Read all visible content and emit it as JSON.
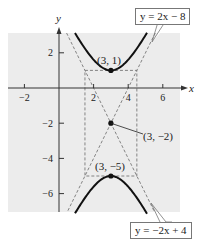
{
  "chart_data": {
    "type": "line",
    "title": "",
    "xlabel": "x",
    "ylabel": "y",
    "xlim": [
      -3,
      7
    ],
    "ylim": [
      -7,
      3
    ],
    "x_ticks": [
      -2,
      2,
      4,
      6
    ],
    "x_tick_labels": [
      "−2",
      "2",
      "4",
      "6"
    ],
    "y_ticks": [
      2,
      -2,
      -4,
      -6
    ],
    "y_tick_labels": [
      "2",
      "−2",
      "−4",
      "−6"
    ],
    "grid": false,
    "background": "#ececec",
    "curve": {
      "name": "hyperbola",
      "equation": "(y+2)^2/9 - (x-3)^2/2.25 = 1",
      "center": [
        3,
        -2
      ],
      "a_vertical": 3,
      "b_horizontal": 1.5,
      "color": "#111111"
    },
    "asymptotes": [
      {
        "label": "y = 2x − 8",
        "slope": 2,
        "intercept": -8
      },
      {
        "label": "y = −2x + 4",
        "slope": -2,
        "intercept": 4
      }
    ],
    "fundamental_rectangle": {
      "x": [
        1.5,
        4.5
      ],
      "y": [
        -5,
        1
      ]
    },
    "points": [
      {
        "x": 3,
        "y": 1,
        "label": "(3, 1)"
      },
      {
        "x": 3,
        "y": -2,
        "label": "(3, −2)"
      },
      {
        "x": 3,
        "y": -5,
        "label": "(3, −5)"
      }
    ]
  },
  "labels": {
    "axis_x": "x",
    "axis_y": "y",
    "upper_asymptote": "y = 2x − 8",
    "lower_asymptote": "y = −2x + 4",
    "vertex_top": "(3, 1)",
    "center": "(3, −2)",
    "vertex_bottom": "(3, −5)"
  }
}
